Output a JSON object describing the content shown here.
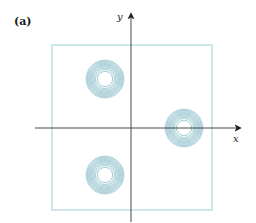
{
  "figure": {
    "panel_label": "(a)",
    "x_axis_label": "x",
    "y_axis_label": "y",
    "colors": {
      "contour": "#4a9aa8",
      "box": "#9fcfd3",
      "axis": "#333333"
    },
    "box": {
      "x": 52,
      "y": 45,
      "width": 160,
      "height": 165
    },
    "origin": {
      "x": 131,
      "y": 128
    },
    "contour_groups": [
      {
        "name": "upper-left",
        "cx": 105,
        "cy": 79,
        "outer_radius": 19
      },
      {
        "name": "right-on-axis",
        "cx": 184,
        "cy": 128,
        "outer_radius": 19
      },
      {
        "name": "lower-left",
        "cx": 105,
        "cy": 175,
        "outer_radius": 19
      }
    ]
  },
  "chart_data": {
    "type": "contour",
    "title": "(a)",
    "xlabel": "x",
    "ylabel": "y",
    "grid": false,
    "peaks": [
      {
        "x": -0.33,
        "y": 0.3
      },
      {
        "x": 0.66,
        "y": 0.0
      },
      {
        "x": -0.33,
        "y": -0.3
      }
    ]
  }
}
